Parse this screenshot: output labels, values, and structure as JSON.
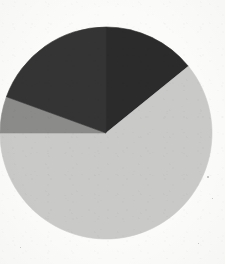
{
  "canvas": {
    "width": 225,
    "height": 264,
    "background_color": "#fbfbfa"
  },
  "chart_data": {
    "type": "pie",
    "title": "",
    "subtitle": "",
    "xlabel": "",
    "ylabel": "",
    "grid": false,
    "legend": "none",
    "labels_shown": false,
    "start_angle_deg": 0,
    "direction": "clockwise",
    "center": {
      "x": 106,
      "y": 133
    },
    "radius": 106,
    "categories": [
      "Slice 1",
      "Slice 2",
      "Slice 3",
      "Slice 4"
    ],
    "values": [
      14.2,
      60.8,
      5.6,
      19.4
    ],
    "value_unit": "percent",
    "slices": [
      {
        "name": "Slice 1",
        "value": 14.2,
        "start_angle_deg": 0,
        "end_angle_deg": 51,
        "sweep_deg": 51,
        "color": "#2b2b2b",
        "shade": "dark"
      },
      {
        "name": "Slice 2",
        "value": 60.8,
        "start_angle_deg": 51,
        "end_angle_deg": 270,
        "sweep_deg": 219,
        "color": "#c9c9c7",
        "shade": "light-gray"
      },
      {
        "name": "Slice 3",
        "value": 5.6,
        "start_angle_deg": 270,
        "end_angle_deg": 290,
        "sweep_deg": 20,
        "color": "#8b8b89",
        "shade": "medium-gray"
      },
      {
        "name": "Slice 4",
        "value": 19.4,
        "start_angle_deg": 290,
        "end_angle_deg": 360,
        "sweep_deg": 70,
        "color": "#343434",
        "shade": "dark-gray"
      }
    ]
  },
  "specks": [
    {
      "x": 207,
      "y": 176,
      "size": 2
    },
    {
      "x": 212,
      "y": 198,
      "size": 1
    },
    {
      "x": 198,
      "y": 243,
      "size": 1
    },
    {
      "x": 20,
      "y": 247,
      "size": 1
    }
  ]
}
